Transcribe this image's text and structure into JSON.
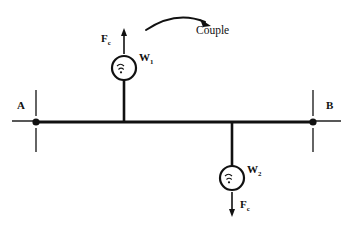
{
  "diagram": {
    "background_color": "#ffffff",
    "stroke_color": "#111111",
    "labels": {
      "couple": "Couple",
      "force_top": "F",
      "force_top_subscript": "c",
      "force_bottom": "F",
      "force_bottom_subscript": "c",
      "weight_top": "W",
      "weight_top_subscript": "1",
      "weight_bottom": "W",
      "weight_bottom_subscript": "2",
      "support_left": "A",
      "support_right": "B"
    },
    "geometry": {
      "beam_y": 122,
      "beam_x_start": 36,
      "beam_x_end": 313,
      "hanger_top_x": 124,
      "hanger_bottom_x": 232,
      "circle_top": {
        "cx": 124,
        "cy": 68,
        "r": 12
      },
      "circle_bottom": {
        "cx": 232,
        "cy": 178,
        "r": 12
      },
      "arrow_up": {
        "x": 124,
        "y_tail": 54,
        "y_head": 30
      },
      "arrow_down": {
        "x": 232,
        "y_tail": 192,
        "y_head": 216
      },
      "couple_arc": {
        "x_start": 146,
        "y_start": 29,
        "x_end": 207,
        "y_end": 20
      }
    }
  }
}
